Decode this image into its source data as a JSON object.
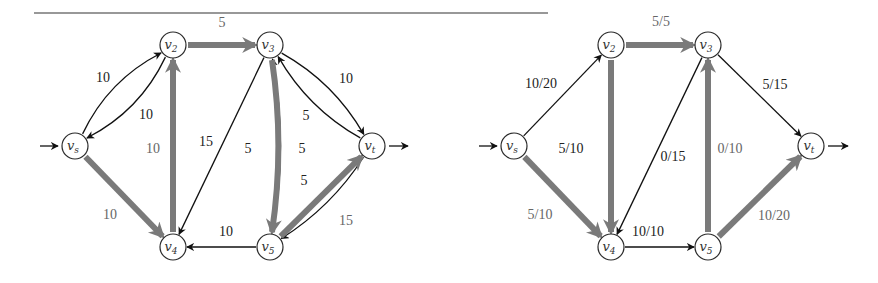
{
  "rule": {
    "x1": 34,
    "x2": 548,
    "y": 13,
    "color": "#333333"
  },
  "colors": {
    "thin": "#111111",
    "thick": "#7a7a7a",
    "label_dark": "#222222",
    "label_gray": "#666666"
  },
  "graphs": [
    {
      "id": "residual-graph",
      "nodes": [
        {
          "id": "vs",
          "base": "v",
          "sub": "s",
          "x": 75,
          "y": 146
        },
        {
          "id": "v2",
          "base": "v",
          "sub": "2",
          "x": 173,
          "y": 45
        },
        {
          "id": "v3",
          "base": "v",
          "sub": "3",
          "x": 270,
          "y": 45
        },
        {
          "id": "v4",
          "base": "v",
          "sub": "4",
          "x": 173,
          "y": 247
        },
        {
          "id": "v5",
          "base": "v",
          "sub": "5",
          "x": 270,
          "y": 247
        },
        {
          "id": "vt",
          "base": "v",
          "sub": "t",
          "x": 372,
          "y": 146
        }
      ],
      "edges": [
        {
          "from": "vs",
          "to": "v2",
          "label": "10",
          "style": "thin",
          "curve": -12,
          "lx": 103,
          "ly": 82,
          "lcolor": "dark"
        },
        {
          "from": "v2",
          "to": "vs",
          "label": "10",
          "style": "thin",
          "curve": -12,
          "lx": 146,
          "ly": 119,
          "lcolor": "dark"
        },
        {
          "from": "v2",
          "to": "v3",
          "label": "5",
          "style": "thick",
          "curve": 0,
          "lx": 222,
          "ly": 27,
          "lcolor": "gray"
        },
        {
          "from": "vs",
          "to": "v4",
          "label": "10",
          "style": "thick",
          "curve": 0,
          "lx": 110,
          "ly": 219,
          "lcolor": "gray"
        },
        {
          "from": "v4",
          "to": "v2",
          "label": "10",
          "style": "thick",
          "curve": 0,
          "lx": 153,
          "ly": 153,
          "lcolor": "gray"
        },
        {
          "from": "v3",
          "to": "v4",
          "label": "15",
          "style": "thin",
          "curve": 0,
          "lx": 206,
          "ly": 146,
          "lcolor": "dark"
        },
        {
          "from": "v5",
          "to": "v3",
          "label": "5",
          "style": "thin",
          "curve": 10,
          "lx": 248,
          "ly": 153,
          "lcolor": "dark"
        },
        {
          "from": "v3",
          "to": "v5",
          "label": "5",
          "style": "thick",
          "curve": -8,
          "lx": 302,
          "ly": 153,
          "lcolor": "dark"
        },
        {
          "from": "v3",
          "to": "vt",
          "label": "10",
          "style": "thin",
          "curve": -10,
          "lx": 346,
          "ly": 83,
          "lcolor": "dark"
        },
        {
          "from": "vt",
          "to": "v3",
          "label": "5",
          "style": "thin",
          "curve": -10,
          "lx": 306,
          "ly": 120,
          "lcolor": "dark"
        },
        {
          "from": "vt",
          "to": "v5",
          "label": "5",
          "style": "thin",
          "curve": -8,
          "lx": 304,
          "ly": 185,
          "lcolor": "dark"
        },
        {
          "from": "v5",
          "to": "vt",
          "label": "15",
          "style": "thick",
          "curve": 0,
          "lx": 346,
          "ly": 225,
          "lcolor": "gray"
        },
        {
          "from": "v5",
          "to": "v4",
          "label": "10",
          "style": "thin",
          "curve": 0,
          "lx": 226,
          "ly": 236,
          "lcolor": "dark"
        }
      ],
      "source_arrow": {
        "x1": 40,
        "x2": 58,
        "y": 146
      },
      "sink_arrow": {
        "x1": 389,
        "x2": 408,
        "y": 146
      }
    },
    {
      "id": "flow-graph",
      "nodes": [
        {
          "id": "vs",
          "base": "v",
          "sub": "s",
          "x": 514,
          "y": 146
        },
        {
          "id": "v2",
          "base": "v",
          "sub": "2",
          "x": 611,
          "y": 45
        },
        {
          "id": "v3",
          "base": "v",
          "sub": "3",
          "x": 708,
          "y": 45
        },
        {
          "id": "v4",
          "base": "v",
          "sub": "4",
          "x": 611,
          "y": 247
        },
        {
          "id": "v5",
          "base": "v",
          "sub": "5",
          "x": 708,
          "y": 247
        },
        {
          "id": "vt",
          "base": "v",
          "sub": "t",
          "x": 811,
          "y": 146
        }
      ],
      "edges": [
        {
          "from": "vs",
          "to": "v2",
          "label": "10/20",
          "style": "thin",
          "curve": 0,
          "lx": 541,
          "ly": 88,
          "lcolor": "dark"
        },
        {
          "from": "v2",
          "to": "v3",
          "label": "5/5",
          "style": "thick",
          "curve": 0,
          "lx": 661,
          "ly": 26,
          "lcolor": "gray"
        },
        {
          "from": "vs",
          "to": "v4",
          "label": "5/10",
          "style": "thick",
          "curve": 0,
          "lx": 540,
          "ly": 219,
          "lcolor": "gray"
        },
        {
          "from": "v2",
          "to": "v4",
          "label": "5/10",
          "style": "thick",
          "curve": 0,
          "lx": 571,
          "ly": 153,
          "lcolor": "dark"
        },
        {
          "from": "v3",
          "to": "v4",
          "label": "0/15",
          "style": "thin",
          "curve": 0,
          "lx": 673,
          "ly": 161,
          "lcolor": "dark"
        },
        {
          "from": "v5",
          "to": "v3",
          "label": "0/10",
          "style": "thick",
          "curve": 0,
          "lx": 730,
          "ly": 153,
          "lcolor": "gray"
        },
        {
          "from": "v3",
          "to": "vt",
          "label": "5/15",
          "style": "thin",
          "curve": 0,
          "lx": 775,
          "ly": 89,
          "lcolor": "dark"
        },
        {
          "from": "v4",
          "to": "v5",
          "label": "10/10",
          "style": "thin",
          "curve": 0,
          "lx": 648,
          "ly": 236,
          "lcolor": "dark"
        },
        {
          "from": "v5",
          "to": "vt",
          "label": "10/20",
          "style": "thick",
          "curve": 0,
          "lx": 774,
          "ly": 220,
          "lcolor": "gray"
        }
      ],
      "source_arrow": {
        "x1": 479,
        "x2": 497,
        "y": 146
      },
      "sink_arrow": {
        "x1": 828,
        "x2": 848,
        "y": 146
      }
    }
  ]
}
